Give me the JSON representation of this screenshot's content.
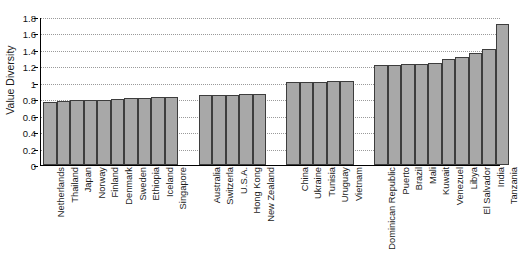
{
  "chart_data": {
    "type": "bar",
    "title": "",
    "xlabel": "",
    "ylabel": "Value Diversity",
    "ylim": [
      0,
      1.8
    ],
    "ytick_labels": [
      "0",
      "0.2",
      "0.4",
      "0.6",
      "0.8",
      "1",
      "1.2",
      "1.4",
      "1.6",
      "1.8"
    ],
    "ytick_values": [
      0,
      0.2,
      0.4,
      0.6,
      0.8,
      1.0,
      1.2,
      1.4,
      1.6,
      1.8
    ],
    "grid": true,
    "legend": "none",
    "bar_color": "#a8a8a8",
    "bar_edge_color": "#3d3d3d",
    "groups": [
      {
        "name": "group-1",
        "categories": [
          "Netherlands",
          "Thailand",
          "Japan",
          "Norway",
          "Finland",
          "Denmark",
          "Sweden",
          "Ethiopia",
          "Iceland",
          "Singapore"
        ],
        "values": [
          0.77,
          0.78,
          0.785,
          0.795,
          0.795,
          0.8,
          0.815,
          0.815,
          0.825,
          0.825
        ]
      },
      {
        "name": "group-2",
        "categories": [
          "Australia",
          "Switzerla",
          "U.S.A.",
          "Hong Kong",
          "New Zealand"
        ],
        "values": [
          0.855,
          0.855,
          0.855,
          0.865,
          0.865
        ]
      },
      {
        "name": "group-3",
        "categories": [
          "China",
          "Ukraine",
          "Tunisia",
          "Uruguay",
          "Vietnam"
        ],
        "values": [
          1.01,
          1.01,
          1.015,
          1.02,
          1.02
        ]
      },
      {
        "name": "group-4",
        "categories": [
          "Dominican Republic",
          "Puerto",
          "Brazil",
          "Mali",
          "Kuwait",
          "Venezuel",
          "Libya",
          "El Salvador",
          "India",
          "Tanzania"
        ],
        "values": [
          1.22,
          1.22,
          1.23,
          1.23,
          1.235,
          1.29,
          1.31,
          1.36,
          1.41,
          1.72
        ]
      }
    ],
    "categories": [
      "Netherlands",
      "Thailand",
      "Japan",
      "Norway",
      "Finland",
      "Denmark",
      "Sweden",
      "Ethiopia",
      "Iceland",
      "Singapore",
      "Australia",
      "Switzerla",
      "U.S.A.",
      "Hong Kong",
      "New Zealand",
      "China",
      "Ukraine",
      "Tunisia",
      "Uruguay",
      "Vietnam",
      "Dominican Republic",
      "Puerto",
      "Brazil",
      "Mali",
      "Kuwait",
      "Venezuel",
      "Libya",
      "El Salvador",
      "India",
      "Tanzania"
    ],
    "values": [
      0.77,
      0.78,
      0.785,
      0.795,
      0.795,
      0.8,
      0.815,
      0.815,
      0.825,
      0.825,
      0.855,
      0.855,
      0.855,
      0.865,
      0.865,
      1.01,
      1.01,
      1.015,
      1.02,
      1.02,
      1.22,
      1.22,
      1.23,
      1.23,
      1.235,
      1.29,
      1.31,
      1.36,
      1.41,
      1.72
    ]
  }
}
